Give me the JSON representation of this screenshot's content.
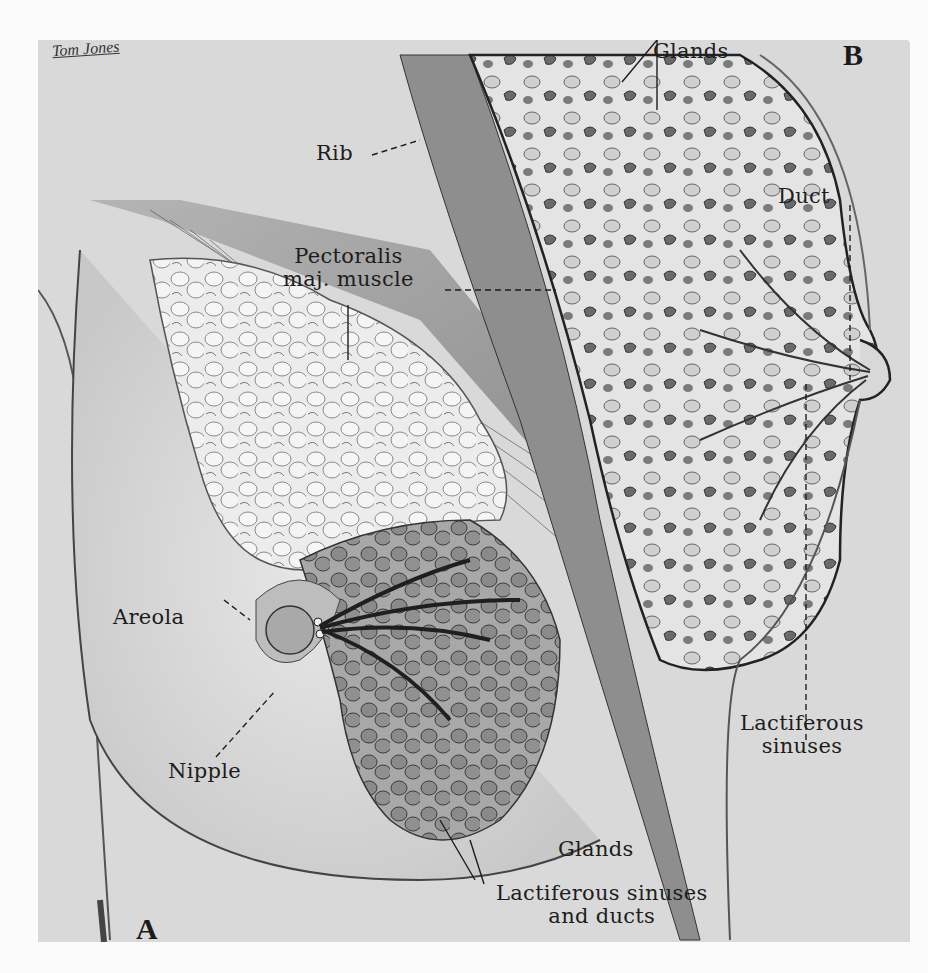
{
  "figure": {
    "signature": "Tom Jones",
    "panels": {
      "a": "A",
      "b": "B"
    }
  },
  "labels": {
    "rib": "Rib",
    "pectoralis_line1": "Pectoralis",
    "pectoralis_line2": "maj. muscle",
    "glands_top": "Glands",
    "duct": "Duct",
    "areola": "Areola",
    "nipple": "Nipple",
    "lactiferous_sinuses_line1": "Lactiferous",
    "lactiferous_sinuses_line2": "sinuses",
    "glands_bottom": "Glands",
    "sinuses_ducts_line1": "Lactiferous sinuses",
    "sinuses_ducts_line2": "and ducts"
  },
  "colors": {
    "background": "#d9d9d9",
    "ink": "#1d1d1d",
    "page": "#fbfbfb"
  }
}
